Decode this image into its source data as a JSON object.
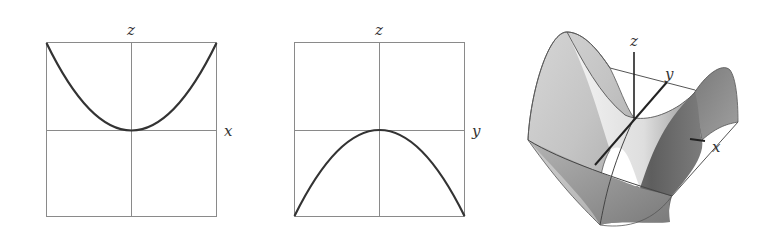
{
  "panels": [
    {
      "name": "xz-cross-section",
      "horizontal_axis": "x",
      "vertical_axis": "z",
      "curve": "upward parabola z = x^2"
    },
    {
      "name": "yz-cross-section",
      "horizontal_axis": "y",
      "vertical_axis": "z",
      "curve": "downward parabola z = -y^2"
    },
    {
      "name": "saddle-surface-3d",
      "axes": [
        "z",
        "y",
        "x"
      ],
      "surface": "hyperbolic paraboloid z = x^2 - y^2"
    }
  ],
  "labels": {
    "p1_z": "z",
    "p1_x": "x",
    "p2_z": "z",
    "p2_y": "y",
    "p3_z": "z",
    "p3_y": "y",
    "p3_x": "x"
  },
  "colors": {
    "frame": "#777777",
    "curve": "#333333",
    "surface_light": "#e8e8e8",
    "surface_dark": "#6a6a6a"
  }
}
